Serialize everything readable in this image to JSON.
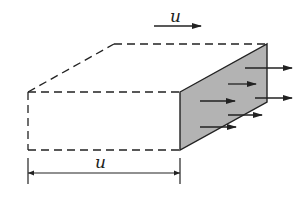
{
  "diagram": {
    "velocity_label": "u",
    "length_label": "u",
    "colors": {
      "stroke": "#222222",
      "shaded_face": "#b3b3b3",
      "background": "#ffffff"
    },
    "box": {
      "front_left_top": [
        28,
        92
      ],
      "front_left_bottom": [
        28,
        150
      ],
      "front_right_top": [
        180,
        92
      ],
      "front_right_bottom": [
        180,
        150
      ],
      "back_left_top": [
        114,
        44
      ],
      "back_right_top": [
        267,
        44
      ],
      "back_right_bottom": [
        267,
        102
      ]
    },
    "flow_arrows": [
      {
        "x1": 245,
        "y1": 68,
        "x2": 292,
        "y2": 68
      },
      {
        "x1": 228,
        "y1": 84,
        "x2": 256,
        "y2": 84
      },
      {
        "x1": 255,
        "y1": 98,
        "x2": 292,
        "y2": 98
      },
      {
        "x1": 200,
        "y1": 101,
        "x2": 235,
        "y2": 101
      },
      {
        "x1": 228,
        "y1": 115,
        "x2": 262,
        "y2": 115
      },
      {
        "x1": 200,
        "y1": 127,
        "x2": 236,
        "y2": 127
      }
    ]
  }
}
